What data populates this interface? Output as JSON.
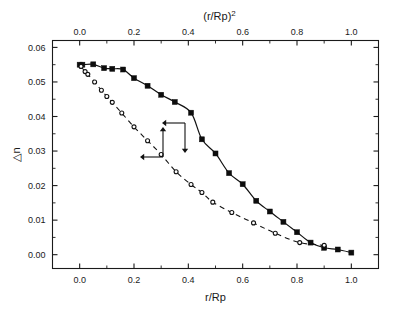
{
  "figure": {
    "width": 396,
    "height": 312,
    "background": "#ffffff",
    "ink_color": "#111111"
  },
  "chart_data": {
    "type": "scatter",
    "title": "",
    "subtitle": "",
    "xlabel": "r/Rp",
    "ylabel": "△n",
    "top_xlabel": "(r/Rp)²",
    "xlim": [
      -0.1,
      1.1
    ],
    "ylim": [
      -0.004,
      0.062
    ],
    "top_xlim": [
      -0.1,
      1.1
    ],
    "grid": false,
    "legend": null,
    "xticks": [
      0.0,
      0.2,
      0.4,
      0.6,
      0.8,
      1.0
    ],
    "xticklabels": [
      "0.0",
      "0.2",
      "0.4",
      "0.6",
      "0.8",
      "1.0"
    ],
    "xminor_step": 0.1,
    "yticks": [
      0.0,
      0.01,
      0.02,
      0.03,
      0.04,
      0.05,
      0.06
    ],
    "yticklabels": [
      "0.00",
      "0.01",
      "0.02",
      "0.03",
      "0.04",
      "0.05",
      "0.06"
    ],
    "yminor_step": 0.005,
    "top_xticks": [
      0.0,
      0.2,
      0.4,
      0.6,
      0.8,
      1.0
    ],
    "top_xticklabels": [
      "0.0",
      "0.2",
      "0.4",
      "0.6",
      "0.8",
      "1.0"
    ],
    "top_xminor_step": 0.1,
    "series": [
      {
        "name": "filled-squares",
        "marker": "square-filled",
        "marker_size": 5.0,
        "line": "solid",
        "axis": "bottom",
        "color": "#0d0d0d",
        "x": [
          0.0,
          0.01,
          0.05,
          0.09,
          0.12,
          0.16,
          0.2,
          0.25,
          0.3,
          0.35,
          0.41,
          0.45,
          0.5,
          0.55,
          0.6,
          0.65,
          0.7,
          0.75,
          0.8,
          0.85,
          0.9,
          0.95,
          1.0
        ],
        "y": [
          0.055,
          0.055,
          0.0551,
          0.054,
          0.0538,
          0.0536,
          0.0511,
          0.0489,
          0.0463,
          0.0442,
          0.0411,
          0.0334,
          0.0293,
          0.0236,
          0.0204,
          0.0156,
          0.0125,
          0.0095,
          0.0065,
          0.0035,
          0.002,
          0.0015,
          0.0006
        ]
      },
      {
        "name": "open-circles",
        "marker": "circle-open",
        "marker_size": 4.0,
        "line": "dashed",
        "axis": "top",
        "color": "#111111",
        "x": [
          0.005,
          0.02,
          0.03,
          0.055,
          0.08,
          0.1,
          0.12,
          0.155,
          0.2,
          0.25,
          0.3,
          0.355,
          0.41,
          0.45,
          0.49,
          0.56,
          0.64,
          0.72,
          0.81,
          0.9
        ],
        "y": [
          0.0545,
          0.053,
          0.0522,
          0.05,
          0.0476,
          0.0458,
          0.0441,
          0.041,
          0.037,
          0.033,
          0.029,
          0.024,
          0.0203,
          0.018,
          0.0152,
          0.0122,
          0.0092,
          0.0062,
          0.0035,
          0.0027
        ]
      }
    ],
    "annotations": [
      {
        "name": "axis-pointer-open-circles",
        "description": "elbow arrow pointing left and up, linking the open-circle series to the top axis",
        "arrow_directions": [
          "left",
          "up"
        ]
      },
      {
        "name": "axis-pointer-filled-squares",
        "description": "elbow arrow pointing left and down, linking the filled-square series to the bottom axis",
        "arrow_directions": [
          "left",
          "down"
        ]
      }
    ]
  }
}
